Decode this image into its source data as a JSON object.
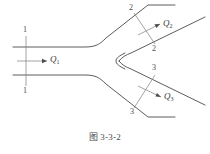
{
  "figure": {
    "caption_prefix": "图",
    "caption_number": "3-3-2",
    "caption_full": "图 3-3-2",
    "line_color": "#4a4a4a",
    "text_color": "#3a3a3a"
  },
  "sections": [
    {
      "id": "section-1",
      "top_label": "1",
      "bottom_label": "1",
      "name": "1-1"
    },
    {
      "id": "section-2",
      "top_label": "2",
      "bottom_label": "2",
      "name": "2-2"
    },
    {
      "id": "section-3",
      "top_label": "3",
      "bottom_label": "3",
      "name": "3-3"
    }
  ],
  "flows": [
    {
      "id": "flow-1",
      "symbol": "Q",
      "subscript": "1",
      "label": "Q1",
      "branch": "inlet-main-pipe"
    },
    {
      "id": "flow-2",
      "symbol": "Q",
      "subscript": "2",
      "label": "Q2",
      "branch": "upper-outlet-branch"
    },
    {
      "id": "flow-3",
      "symbol": "Q",
      "subscript": "3",
      "label": "Q3",
      "branch": "lower-outlet-branch"
    }
  ]
}
